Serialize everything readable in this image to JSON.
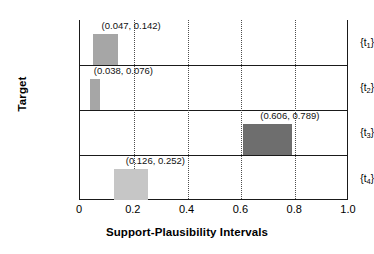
{
  "chart_data": {
    "type": "bar",
    "orientation": "horizontal-interval",
    "title": "",
    "xlabel": "Support-Plausibility Intervals",
    "ylabel": "Target",
    "xlim": [
      0.0,
      1.0
    ],
    "xticks": [
      "0",
      "0.2",
      "0.4",
      "0.6",
      "0.8",
      "1.0"
    ],
    "xtick_values": [
      0.0,
      0.2,
      0.4,
      0.6,
      0.8,
      1.0
    ],
    "gridlines": [
      0.2,
      0.4,
      0.6,
      0.8
    ],
    "grid": true,
    "legend": "none",
    "categories": [
      "{t1}",
      "{t2}",
      "{t3}",
      "{t4}"
    ],
    "bars": [
      {
        "category": "t",
        "subscript": "1",
        "low": 0.047,
        "high": 0.142,
        "label": "(0.047, 0.142)",
        "color": "#a6a6a6"
      },
      {
        "category": "t",
        "subscript": "2",
        "low": 0.038,
        "high": 0.076,
        "label": "(0.038, 0.076)",
        "color": "#a6a6a6"
      },
      {
        "category": "t",
        "subscript": "3",
        "low": 0.606,
        "high": 0.789,
        "label": "(0.606, 0.789)",
        "color": "#6e6e6e"
      },
      {
        "category": "t",
        "subscript": "4",
        "low": 0.126,
        "high": 0.252,
        "label": "(0.126, 0.252)",
        "color": "#c6c6c6"
      }
    ],
    "colors": {
      "axis": "#1a1a1a",
      "grid": "#4d4d4d",
      "background": "#ffffff",
      "bar_light": "#c6c6c6",
      "bar_medium": "#a6a6a6",
      "bar_dark": "#6e6e6e"
    }
  }
}
